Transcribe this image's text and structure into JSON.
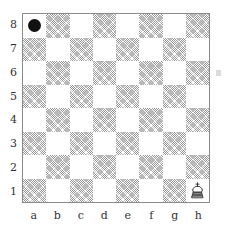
{
  "diagram": {
    "type": "chessboard",
    "orientation": "white-bottom",
    "board_size": 8,
    "rank_labels": [
      "8",
      "7",
      "6",
      "5",
      "4",
      "3",
      "2",
      "1"
    ],
    "file_labels": [
      "a",
      "b",
      "c",
      "d",
      "e",
      "f",
      "g",
      "h"
    ],
    "colors": {
      "light_square": "#ffffff",
      "dark_square_hatch": "#6e6e6e",
      "border": "#8a8a8a",
      "label_text": "#333333",
      "black_piece": "#111111",
      "white_piece_outline": "#222222",
      "page_background": "#ffffff"
    },
    "pieces": [
      {
        "square": "a8",
        "file": "a",
        "rank": "8",
        "color": "black",
        "piece": "marker-dot",
        "glyph": "dot",
        "icon_name": "black-marker-dot-icon"
      },
      {
        "square": "h1",
        "file": "h",
        "rank": "1",
        "color": "white",
        "piece": "king",
        "glyph": "♔",
        "icon_name": "white-king-icon"
      }
    ],
    "squares": [
      {
        "id": "a8",
        "shade": "light"
      },
      {
        "id": "b8",
        "shade": "dark"
      },
      {
        "id": "c8",
        "shade": "light"
      },
      {
        "id": "d8",
        "shade": "dark"
      },
      {
        "id": "e8",
        "shade": "light"
      },
      {
        "id": "f8",
        "shade": "dark"
      },
      {
        "id": "g8",
        "shade": "light"
      },
      {
        "id": "h8",
        "shade": "dark"
      },
      {
        "id": "a7",
        "shade": "dark"
      },
      {
        "id": "b7",
        "shade": "light"
      },
      {
        "id": "c7",
        "shade": "dark"
      },
      {
        "id": "d7",
        "shade": "light"
      },
      {
        "id": "e7",
        "shade": "dark"
      },
      {
        "id": "f7",
        "shade": "light"
      },
      {
        "id": "g7",
        "shade": "dark"
      },
      {
        "id": "h7",
        "shade": "light"
      },
      {
        "id": "a6",
        "shade": "light"
      },
      {
        "id": "b6",
        "shade": "dark"
      },
      {
        "id": "c6",
        "shade": "light"
      },
      {
        "id": "d6",
        "shade": "dark"
      },
      {
        "id": "e6",
        "shade": "light"
      },
      {
        "id": "f6",
        "shade": "dark"
      },
      {
        "id": "g6",
        "shade": "light"
      },
      {
        "id": "h6",
        "shade": "dark"
      },
      {
        "id": "a5",
        "shade": "dark"
      },
      {
        "id": "b5",
        "shade": "light"
      },
      {
        "id": "c5",
        "shade": "dark"
      },
      {
        "id": "d5",
        "shade": "light"
      },
      {
        "id": "e5",
        "shade": "dark"
      },
      {
        "id": "f5",
        "shade": "light"
      },
      {
        "id": "g5",
        "shade": "dark"
      },
      {
        "id": "h5",
        "shade": "light"
      },
      {
        "id": "a4",
        "shade": "light"
      },
      {
        "id": "b4",
        "shade": "dark"
      },
      {
        "id": "c4",
        "shade": "light"
      },
      {
        "id": "d4",
        "shade": "dark"
      },
      {
        "id": "e4",
        "shade": "light"
      },
      {
        "id": "f4",
        "shade": "dark"
      },
      {
        "id": "g4",
        "shade": "light"
      },
      {
        "id": "h4",
        "shade": "dark"
      },
      {
        "id": "a3",
        "shade": "dark"
      },
      {
        "id": "b3",
        "shade": "light"
      },
      {
        "id": "c3",
        "shade": "dark"
      },
      {
        "id": "d3",
        "shade": "light"
      },
      {
        "id": "e3",
        "shade": "dark"
      },
      {
        "id": "f3",
        "shade": "light"
      },
      {
        "id": "g3",
        "shade": "dark"
      },
      {
        "id": "h3",
        "shade": "light"
      },
      {
        "id": "a2",
        "shade": "light"
      },
      {
        "id": "b2",
        "shade": "dark"
      },
      {
        "id": "c2",
        "shade": "light"
      },
      {
        "id": "d2",
        "shade": "dark"
      },
      {
        "id": "e2",
        "shade": "light"
      },
      {
        "id": "f2",
        "shade": "dark"
      },
      {
        "id": "g2",
        "shade": "light"
      },
      {
        "id": "h2",
        "shade": "dark"
      },
      {
        "id": "a1",
        "shade": "dark"
      },
      {
        "id": "b1",
        "shade": "light"
      },
      {
        "id": "c1",
        "shade": "dark"
      },
      {
        "id": "d1",
        "shade": "light"
      },
      {
        "id": "e1",
        "shade": "dark"
      },
      {
        "id": "f1",
        "shade": "light"
      },
      {
        "id": "g1",
        "shade": "dark"
      },
      {
        "id": "h1",
        "shade": "light"
      }
    ]
  }
}
